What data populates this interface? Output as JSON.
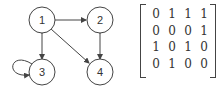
{
  "graph": {
    "nodes": [
      {
        "id": "1",
        "label": "1",
        "x": 42,
        "y": 20
      },
      {
        "id": "2",
        "label": "2",
        "x": 100,
        "y": 20
      },
      {
        "id": "3",
        "label": "3",
        "x": 42,
        "y": 72
      },
      {
        "id": "4",
        "label": "4",
        "x": 100,
        "y": 72
      }
    ],
    "edges": [
      {
        "from": "1",
        "to": "2",
        "directed": true
      },
      {
        "from": "1",
        "to": "3",
        "directed": true,
        "bidirectional": true
      },
      {
        "from": "1",
        "to": "4",
        "directed": true
      },
      {
        "from": "2",
        "to": "4",
        "directed": true,
        "bidirectional": true
      },
      {
        "from": "3",
        "to": "3",
        "self_loop": true
      }
    ]
  },
  "matrix": {
    "rows": [
      [
        "0",
        "1",
        "1",
        "1"
      ],
      [
        "0",
        "0",
        "0",
        "1"
      ],
      [
        "1",
        "0",
        "1",
        "0"
      ],
      [
        "0",
        "1",
        "0",
        "0"
      ]
    ]
  },
  "colors": {
    "stroke": "#444444",
    "text": "#333333"
  }
}
